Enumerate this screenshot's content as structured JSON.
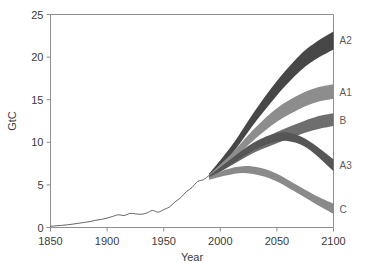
{
  "chart_data": {
    "type": "area",
    "title": "",
    "subtitle": "",
    "xlabel": "Year",
    "ylabel": "GtC",
    "xlim": [
      1850,
      2100
    ],
    "ylim": [
      0,
      25
    ],
    "grid": false,
    "legend_position": "right-edge-inline",
    "xticks": [
      1850,
      1900,
      1950,
      2000,
      2050,
      2100
    ],
    "xtick_labels": [
      "1850",
      "1900",
      "1950",
      "2000",
      "2050",
      "2100"
    ],
    "yticks": [
      0,
      5,
      10,
      15,
      20,
      25
    ],
    "ytick_labels": [
      "0",
      "5",
      "10",
      "15",
      "20",
      "25"
    ],
    "historical": {
      "name": "Historical emissions",
      "color": "#555555",
      "x": [
        1850,
        1855,
        1860,
        1865,
        1870,
        1875,
        1880,
        1885,
        1890,
        1895,
        1900,
        1905,
        1910,
        1915,
        1920,
        1925,
        1930,
        1935,
        1940,
        1945,
        1950,
        1955,
        1960,
        1965,
        1970,
        1975,
        1980,
        1985,
        1990
      ],
      "y": [
        0.15,
        0.2,
        0.25,
        0.32,
        0.4,
        0.5,
        0.6,
        0.7,
        0.85,
        0.95,
        1.1,
        1.3,
        1.5,
        1.4,
        1.65,
        1.6,
        1.55,
        1.7,
        2.0,
        1.8,
        2.1,
        2.4,
        3.0,
        3.5,
        4.2,
        4.7,
        5.4,
        5.6,
        6.1
      ]
    },
    "series": [
      {
        "name": "A2",
        "label": "A2",
        "color": "#474747",
        "label_color": "#3a3a3a",
        "x": [
          1990,
          2010,
          2030,
          2050,
          2070,
          2085,
          2100
        ],
        "upper": [
          6.3,
          9.6,
          13.6,
          17.2,
          20.2,
          21.8,
          23.0
        ],
        "lower": [
          5.9,
          8.6,
          12.2,
          15.5,
          18.3,
          19.8,
          20.9
        ]
      },
      {
        "name": "A1",
        "label": "A1",
        "color": "#8d8d8d",
        "label_color": "#6a6a6a",
        "x": [
          1990,
          2010,
          2030,
          2050,
          2070,
          2085,
          2100
        ],
        "upper": [
          6.2,
          8.7,
          11.6,
          14.0,
          15.6,
          16.4,
          16.8
        ],
        "lower": [
          5.9,
          7.9,
          10.3,
          12.4,
          13.9,
          14.7,
          15.1
        ]
      },
      {
        "name": "B",
        "label": "B",
        "color": "#6e6e6e",
        "label_color": "#5a5a5a",
        "x": [
          1990,
          2010,
          2030,
          2050,
          2070,
          2085,
          2100
        ],
        "upper": [
          6.1,
          8.0,
          9.8,
          11.2,
          12.3,
          13.0,
          13.4
        ],
        "lower": [
          5.8,
          7.3,
          8.8,
          9.9,
          10.9,
          11.5,
          11.9
        ]
      },
      {
        "name": "A3",
        "label": "A3",
        "color": "#565656",
        "label_color": "#4a4a4a",
        "x": [
          1990,
          2010,
          2030,
          2050,
          2065,
          2080,
          2100
        ],
        "upper": [
          6.0,
          8.1,
          10.0,
          11.1,
          11.0,
          10.0,
          8.0
        ],
        "lower": [
          5.7,
          7.4,
          9.1,
          10.1,
          10.0,
          9.0,
          6.6
        ]
      },
      {
        "name": "C",
        "label": "C",
        "color": "#8a8a8a",
        "label_color": "#6a6a6a",
        "x": [
          1990,
          2005,
          2020,
          2035,
          2050,
          2070,
          2085,
          2100
        ],
        "upper": [
          5.9,
          6.8,
          7.2,
          7.0,
          6.3,
          4.8,
          3.7,
          2.8
        ],
        "lower": [
          5.6,
          6.1,
          6.4,
          6.1,
          5.4,
          3.9,
          2.7,
          1.6
        ]
      }
    ]
  },
  "axis": {
    "ylabel": "GtC",
    "xlabel": "Year"
  }
}
